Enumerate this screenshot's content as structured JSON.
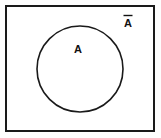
{
  "figure": {
    "type": "venn-diagram",
    "background_color": "#fefefe",
    "line_color": "#1a1a1a",
    "universal_set": {
      "shape": "rectangle",
      "name": "universal-set-rectangle",
      "x": 6,
      "y": 6,
      "width": 148,
      "height": 125,
      "stroke_width": 2,
      "fill": "#ffffff"
    },
    "set_a": {
      "shape": "circle",
      "name": "set-a-circle",
      "cx": 80,
      "cy": 69,
      "r": 43,
      "stroke_width": 1.6,
      "fill": "none"
    },
    "labels": [
      {
        "id": "set-a-label",
        "text": "A",
        "x": 78,
        "y": 50,
        "overbar": false,
        "meaning": "set A (inside circle)"
      },
      {
        "id": "complement-label",
        "text": "A",
        "x": 128,
        "y": 23,
        "overbar": true,
        "meaning": "A-bar, complement of A (outside circle, inside rectangle)"
      }
    ]
  }
}
